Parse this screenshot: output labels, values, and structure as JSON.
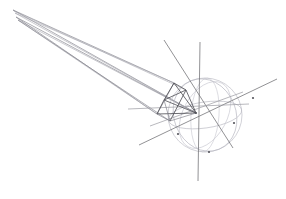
{
  "figure": {
    "background_color": "#ffffff",
    "width": 286,
    "height": 199
  },
  "palette": {
    "axis": "#6e6e72",
    "axis_faint": "#9a9aa0",
    "sphere": "#b9b9c2",
    "sphere_soft": "#c8c8d0",
    "polyhedron": "#4a4a50",
    "polyhedron_soft": "#7d7d86",
    "cone": "#8a8a92",
    "cone_soft": "#a8a8b0",
    "node": "#55555c"
  },
  "chart_data": {
    "type": "scatter",
    "xlabel": "",
    "ylabel": "",
    "grid": false,
    "legend": "none",
    "xlim": [
      0,
      286
    ],
    "ylim": [
      0,
      199
    ],
    "hub": {
      "x": 196,
      "y": 113
    },
    "sphere": {
      "center_x": 205,
      "center_y": 115,
      "radius": 37,
      "great_circles": [
        {
          "name": "equator-ellipse",
          "rx": 37,
          "ry": 13,
          "rotate": -8
        },
        {
          "name": "meridian-ellipse",
          "rx": 14,
          "ry": 37,
          "rotate": 4
        },
        {
          "name": "oblique-ellipse-a",
          "rx": 31,
          "ry": 37,
          "rotate": -22
        },
        {
          "name": "oblique-ellipse-b",
          "rx": 22,
          "ry": 36,
          "rotate": 28
        },
        {
          "name": "limb-circle",
          "rx": 37,
          "ry": 37,
          "rotate": 0
        }
      ]
    },
    "axes": [
      {
        "name": "vertical-axis",
        "x1": 200,
        "y1": 42,
        "x2": 198,
        "y2": 181
      },
      {
        "name": "diagonal-axis-ne-sw",
        "x1": 277,
        "y1": 79,
        "x2": 139,
        "y2": 145
      },
      {
        "name": "diagonal-axis-nw-se",
        "x1": 164,
        "y1": 40,
        "x2": 233,
        "y2": 148
      },
      {
        "name": "diagonal-axis-e-w",
        "x1": 249,
        "y1": 104,
        "x2": 128,
        "y2": 109
      },
      {
        "name": "diagonal-axis-short",
        "x1": 243,
        "y1": 92,
        "x2": 150,
        "y2": 126
      }
    ],
    "polyhedron": {
      "name": "tetrahedron",
      "vertices": [
        {
          "id": "v0",
          "x": 196,
          "y": 113
        },
        {
          "id": "v1",
          "x": 174,
          "y": 83
        },
        {
          "id": "v2",
          "x": 157,
          "y": 114
        },
        {
          "id": "v3",
          "x": 170,
          "y": 121
        },
        {
          "id": "v4",
          "x": 186,
          "y": 90
        },
        {
          "id": "v5",
          "x": 164,
          "y": 100
        }
      ],
      "edges": [
        [
          "v0",
          "v1"
        ],
        [
          "v0",
          "v2"
        ],
        [
          "v0",
          "v3"
        ],
        [
          "v0",
          "v4"
        ],
        [
          "v0",
          "v5"
        ],
        [
          "v1",
          "v2"
        ],
        [
          "v1",
          "v4"
        ],
        [
          "v1",
          "v5"
        ],
        [
          "v2",
          "v3"
        ],
        [
          "v2",
          "v5"
        ],
        [
          "v3",
          "v4"
        ],
        [
          "v3",
          "v5"
        ],
        [
          "v4",
          "v5"
        ]
      ]
    },
    "cone": {
      "name": "elongated-cone-beam",
      "apex_x": 196,
      "apex_y": 113,
      "rays": [
        {
          "x1": 196,
          "y1": 113,
          "x2": 13,
          "y2": 10
        },
        {
          "x1": 196,
          "y1": 113,
          "x2": 15,
          "y2": 13
        },
        {
          "x1": 196,
          "y1": 113,
          "x2": 16,
          "y2": 17
        },
        {
          "x1": 196,
          "y1": 113,
          "x2": 18,
          "y2": 20
        },
        {
          "x1": 174,
          "y1": 83,
          "x2": 13,
          "y2": 10
        },
        {
          "x1": 174,
          "y1": 83,
          "x2": 15,
          "y2": 13
        },
        {
          "x1": 157,
          "y1": 114,
          "x2": 16,
          "y2": 17
        },
        {
          "x1": 157,
          "y1": 114,
          "x2": 18,
          "y2": 20
        },
        {
          "x1": 170,
          "y1": 121,
          "x2": 18,
          "y2": 20
        },
        {
          "x1": 186,
          "y1": 90,
          "x2": 14,
          "y2": 11
        }
      ]
    },
    "nodes": [
      {
        "name": "hub-node",
        "x": 196,
        "y": 113
      },
      {
        "name": "sphere-node-right",
        "x": 253,
        "y": 98
      },
      {
        "name": "sphere-node-low",
        "x": 178,
        "y": 134
      },
      {
        "name": "sphere-node-bottom",
        "x": 209,
        "y": 152
      },
      {
        "name": "sphere-node-east",
        "x": 234,
        "y": 123
      }
    ]
  }
}
